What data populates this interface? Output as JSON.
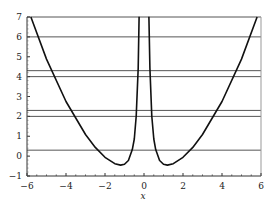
{
  "chart_data": {
    "type": "line",
    "title": "",
    "xlabel": "x",
    "ylabel": "",
    "xlim": [
      -6,
      6
    ],
    "ylim": [
      -1,
      7
    ],
    "x_ticks": [
      -6,
      -4,
      -2,
      0,
      2,
      4,
      6
    ],
    "y_ticks": [
      -1,
      0,
      1,
      2,
      3,
      4,
      5,
      6,
      7
    ],
    "x_tick_labels": [
      "−6",
      "−4",
      "−2",
      "0",
      "2",
      "4",
      "6"
    ],
    "y_tick_labels": [
      "−1",
      "0",
      "1",
      "2",
      "3",
      "4",
      "5",
      "6",
      "7"
    ],
    "grid": false,
    "legend": null,
    "series": [
      {
        "name": "curve",
        "description": "Symmetric curve with vertical asymptote at x=0, approx f(x)=0.242x^2+0.5/x^2-1.15",
        "color": "#111111",
        "x": [
          -5.8,
          -5,
          -4,
          -3,
          -2.5,
          -2,
          -1.5,
          -1.2,
          -1,
          -0.8,
          -0.6,
          -0.5,
          -0.4,
          -0.3,
          -0.25,
          0.25,
          0.3,
          0.4,
          0.5,
          0.6,
          0.8,
          1,
          1.2,
          1.5,
          2,
          2.5,
          3,
          4,
          5,
          5.8
        ],
        "y": [
          7.0,
          4.88,
          2.75,
          1.09,
          0.44,
          -0.06,
          -0.38,
          -0.45,
          -0.41,
          -0.22,
          0.33,
          0.86,
          2.01,
          4.43,
          7.01,
          7.01,
          4.43,
          2.01,
          0.86,
          0.33,
          -0.22,
          -0.41,
          -0.45,
          -0.38,
          -0.06,
          0.44,
          1.09,
          2.75,
          4.88,
          7.0
        ]
      }
    ],
    "horizontal_lines": [
      7,
      6,
      4.3,
      4,
      2.3,
      2,
      0.3
    ]
  }
}
